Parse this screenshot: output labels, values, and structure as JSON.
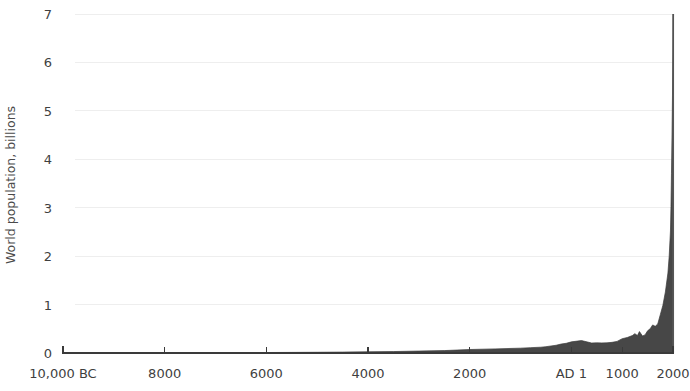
{
  "chart_data": {
    "type": "area",
    "title": "",
    "subtitle": "",
    "xlabel": "",
    "ylabel": "World population, billions",
    "grid": true,
    "legend": null,
    "annotations": [],
    "xlim": [
      -10000,
      2000
    ],
    "ylim": [
      0,
      7
    ],
    "y_ticks": [
      0,
      1,
      2,
      3,
      4,
      5,
      6,
      7
    ],
    "y_tick_labels": [
      "0",
      "1",
      "2",
      "3",
      "4",
      "5",
      "6",
      "7"
    ],
    "x_ticks": [
      -10000,
      -8000,
      -6000,
      -4000,
      -2000,
      1,
      1000,
      2000
    ],
    "x_tick_labels": [
      "10,000 BC",
      "8000",
      "6000",
      "4000",
      "2000",
      "AD 1",
      "1000",
      "2000"
    ],
    "series_name": "World population",
    "series_color": "#474747",
    "grid_color": "#eeeeee",
    "axis_color": "#3a3a3a",
    "x": [
      -10000,
      -9500,
      -9000,
      -8500,
      -8000,
      -7500,
      -7000,
      -6500,
      -6000,
      -5500,
      -5000,
      -4500,
      -4000,
      -3500,
      -3000,
      -2500,
      -2000,
      -1500,
      -1000,
      -800,
      -600,
      -500,
      -400,
      -300,
      -200,
      -100,
      1,
      200,
      400,
      500,
      600,
      700,
      800,
      900,
      1000,
      1100,
      1200,
      1250,
      1300,
      1340,
      1400,
      1450,
      1500,
      1550,
      1600,
      1650,
      1700,
      1750,
      1800,
      1850,
      1900,
      1925,
      1950,
      1960,
      1970,
      1980,
      1990,
      2000,
      2011
    ],
    "y": [
      0.004,
      0.004,
      0.005,
      0.005,
      0.005,
      0.006,
      0.007,
      0.008,
      0.01,
      0.012,
      0.015,
      0.019,
      0.025,
      0.03,
      0.04,
      0.05,
      0.072,
      0.085,
      0.1,
      0.11,
      0.12,
      0.13,
      0.145,
      0.16,
      0.185,
      0.2,
      0.23,
      0.257,
      0.206,
      0.21,
      0.208,
      0.21,
      0.22,
      0.24,
      0.295,
      0.32,
      0.36,
      0.4,
      0.36,
      0.443,
      0.35,
      0.374,
      0.458,
      0.5,
      0.58,
      0.55,
      0.6,
      0.79,
      0.98,
      1.26,
      1.65,
      2.0,
      2.52,
      3.02,
      3.7,
      4.44,
      5.32,
      6.13,
      7.0
    ]
  },
  "axis": {
    "y_title": "World population, billions"
  }
}
